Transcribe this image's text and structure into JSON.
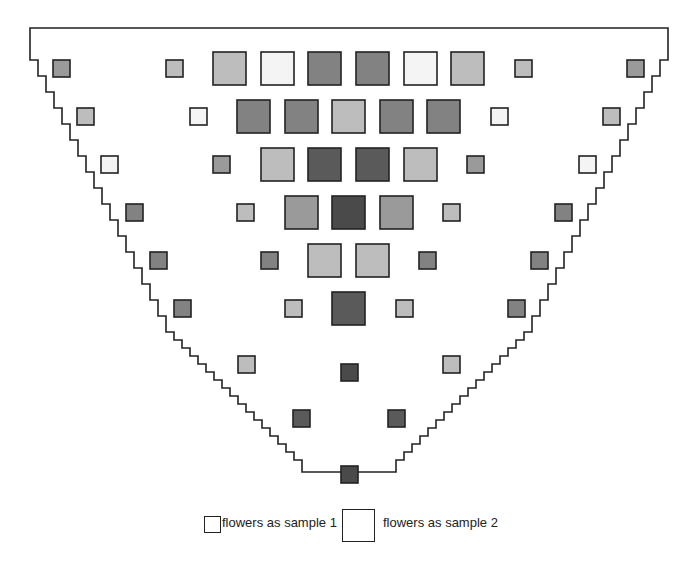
{
  "figure": {
    "outline": {
      "stroke": "#222222",
      "top_left": [
        30,
        28
      ],
      "top_right": [
        668,
        28
      ],
      "tip_bottom_y": 472
    },
    "shades": {
      "white": "#f4f4f4",
      "light": "#bdbdbd",
      "medium": "#9a9a9a",
      "mid_dark": "#828282",
      "dark": "#5a5a5a",
      "darker": "#4a4a4a"
    },
    "squares": [
      {
        "x": 53,
        "y": 60,
        "s": 17,
        "shade": "medium"
      },
      {
        "x": 166,
        "y": 60,
        "s": 17,
        "shade": "light"
      },
      {
        "x": 213,
        "y": 52,
        "s": 33,
        "shade": "light"
      },
      {
        "x": 261,
        "y": 52,
        "s": 33,
        "shade": "white"
      },
      {
        "x": 308,
        "y": 52,
        "s": 33,
        "shade": "mid_dark"
      },
      {
        "x": 356,
        "y": 52,
        "s": 33,
        "shade": "mid_dark"
      },
      {
        "x": 404,
        "y": 52,
        "s": 33,
        "shade": "white"
      },
      {
        "x": 451,
        "y": 52,
        "s": 33,
        "shade": "light"
      },
      {
        "x": 515,
        "y": 60,
        "s": 17,
        "shade": "light"
      },
      {
        "x": 627,
        "y": 60,
        "s": 17,
        "shade": "medium"
      },
      {
        "x": 77,
        "y": 108,
        "s": 17,
        "shade": "light"
      },
      {
        "x": 190,
        "y": 108,
        "s": 17,
        "shade": "white"
      },
      {
        "x": 237,
        "y": 100,
        "s": 33,
        "shade": "mid_dark"
      },
      {
        "x": 285,
        "y": 100,
        "s": 33,
        "shade": "mid_dark"
      },
      {
        "x": 332,
        "y": 100,
        "s": 33,
        "shade": "light"
      },
      {
        "x": 380,
        "y": 100,
        "s": 33,
        "shade": "mid_dark"
      },
      {
        "x": 427,
        "y": 100,
        "s": 33,
        "shade": "mid_dark"
      },
      {
        "x": 491,
        "y": 108,
        "s": 17,
        "shade": "white"
      },
      {
        "x": 603,
        "y": 108,
        "s": 17,
        "shade": "light"
      },
      {
        "x": 101,
        "y": 156,
        "s": 17,
        "shade": "white"
      },
      {
        "x": 213,
        "y": 156,
        "s": 17,
        "shade": "medium"
      },
      {
        "x": 261,
        "y": 148,
        "s": 33,
        "shade": "light"
      },
      {
        "x": 308,
        "y": 148,
        "s": 33,
        "shade": "dark"
      },
      {
        "x": 356,
        "y": 148,
        "s": 33,
        "shade": "dark"
      },
      {
        "x": 404,
        "y": 148,
        "s": 33,
        "shade": "light"
      },
      {
        "x": 467,
        "y": 156,
        "s": 17,
        "shade": "medium"
      },
      {
        "x": 579,
        "y": 156,
        "s": 17,
        "shade": "white"
      },
      {
        "x": 126,
        "y": 204,
        "s": 17,
        "shade": "mid_dark"
      },
      {
        "x": 237,
        "y": 204,
        "s": 17,
        "shade": "light"
      },
      {
        "x": 285,
        "y": 196,
        "s": 33,
        "shade": "medium"
      },
      {
        "x": 332,
        "y": 196,
        "s": 33,
        "shade": "darker"
      },
      {
        "x": 380,
        "y": 196,
        "s": 33,
        "shade": "medium"
      },
      {
        "x": 443,
        "y": 204,
        "s": 17,
        "shade": "light"
      },
      {
        "x": 555,
        "y": 204,
        "s": 17,
        "shade": "mid_dark"
      },
      {
        "x": 150,
        "y": 252,
        "s": 17,
        "shade": "mid_dark"
      },
      {
        "x": 261,
        "y": 252,
        "s": 17,
        "shade": "mid_dark"
      },
      {
        "x": 308,
        "y": 244,
        "s": 33,
        "shade": "light"
      },
      {
        "x": 356,
        "y": 244,
        "s": 33,
        "shade": "light"
      },
      {
        "x": 419,
        "y": 252,
        "s": 17,
        "shade": "mid_dark"
      },
      {
        "x": 531,
        "y": 252,
        "s": 17,
        "shade": "mid_dark"
      },
      {
        "x": 174,
        "y": 300,
        "s": 17,
        "shade": "mid_dark"
      },
      {
        "x": 285,
        "y": 300,
        "s": 17,
        "shade": "light"
      },
      {
        "x": 332,
        "y": 292,
        "s": 33,
        "shade": "dark"
      },
      {
        "x": 396,
        "y": 300,
        "s": 17,
        "shade": "light"
      },
      {
        "x": 508,
        "y": 300,
        "s": 17,
        "shade": "mid_dark"
      },
      {
        "x": 238,
        "y": 356,
        "s": 17,
        "shade": "light"
      },
      {
        "x": 341,
        "y": 364,
        "s": 17,
        "shade": "darker"
      },
      {
        "x": 443,
        "y": 356,
        "s": 17,
        "shade": "light"
      },
      {
        "x": 293,
        "y": 410,
        "s": 17,
        "shade": "dark"
      },
      {
        "x": 388,
        "y": 410,
        "s": 17,
        "shade": "dark"
      },
      {
        "x": 341,
        "y": 466,
        "s": 17,
        "shade": "darker"
      }
    ]
  },
  "legend": {
    "items": [
      {
        "label": "flowers as sample 1",
        "box_size": "small"
      },
      {
        "label": "flowers as sample 2",
        "box_size": "large"
      }
    ]
  }
}
